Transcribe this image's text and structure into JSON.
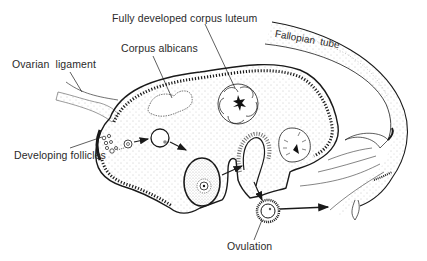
{
  "diagram": {
    "labels": {
      "corpus_luteum": "Fully developed corpus luteum",
      "corpus_albicans": "Corpus albicans",
      "ovarian_ligament": "Ovarian  ligament",
      "fallopian_tube": "Fallopian  tube",
      "developing_follicles": "Developing follicles",
      "ovulation": "Ovulation"
    },
    "colors": {
      "ink": "#1a1a1a",
      "stipple": "#9a9a9a",
      "background": "#ffffff",
      "label_text": "#2a2a2a"
    },
    "sequence": [
      "Developing follicles",
      "Growing follicle",
      "Mature follicle",
      "Ruptured follicle",
      "Ovulation",
      "Fallopian tube"
    ]
  }
}
